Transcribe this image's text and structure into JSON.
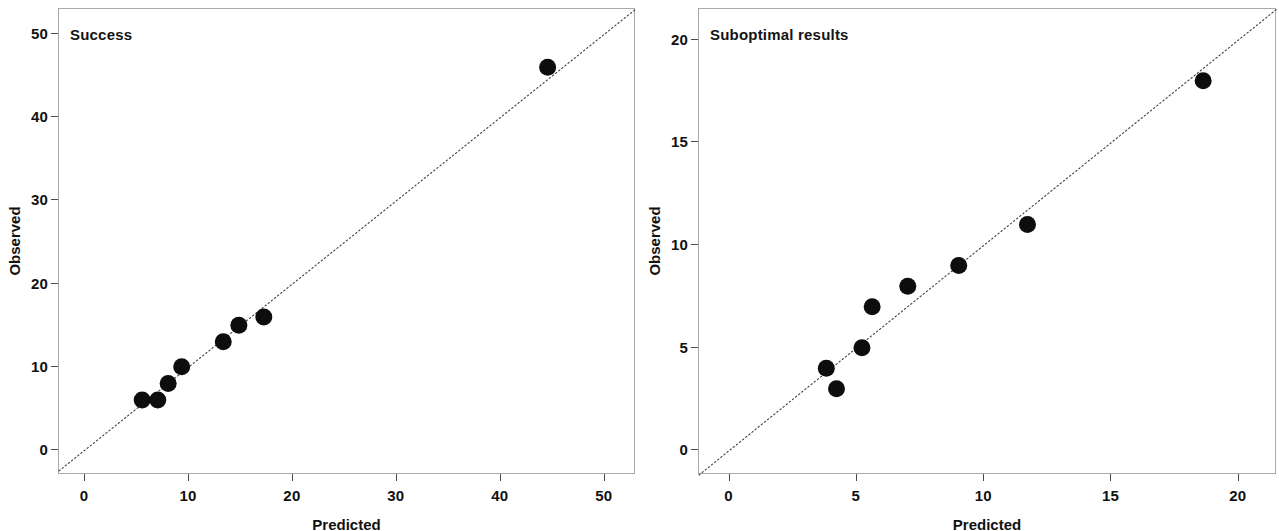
{
  "figure": {
    "background_color": "#ffffff",
    "marker_color": "#0d0d0d",
    "axis_color": "#a9a9a9",
    "reference_line_color": "#3f3f3f"
  },
  "panels": {
    "left": {
      "title": "Success",
      "xlabel": "Predicted",
      "ylabel": "Observed",
      "xticks": [
        "0",
        "10",
        "20",
        "30",
        "40",
        "50"
      ],
      "yticks": [
        "0",
        "10",
        "20",
        "30",
        "40",
        "50"
      ]
    },
    "right": {
      "title": "Suboptimal results",
      "xlabel": "Predicted",
      "ylabel": "Observed",
      "xticks": [
        "0",
        "5",
        "10",
        "15",
        "20"
      ],
      "yticks": [
        "0",
        "5",
        "10",
        "15",
        "20"
      ]
    }
  },
  "chart_data": [
    {
      "type": "scatter",
      "title": "Success",
      "xlabel": "Predicted",
      "ylabel": "Observed",
      "xlim": [
        -2.5,
        53
      ],
      "ylim": [
        -3,
        53
      ],
      "xticks": [
        0,
        10,
        20,
        30,
        40,
        50
      ],
      "yticks": [
        0,
        10,
        20,
        30,
        40,
        50
      ],
      "grid": false,
      "legend": null,
      "reference_line": {
        "type": "identity",
        "slope": 1,
        "intercept": 0,
        "style": "dotted"
      },
      "series": [
        {
          "name": "Success",
          "marker": "filled-circle",
          "x": [
            5.5,
            7.0,
            8.0,
            9.3,
            13.3,
            14.8,
            17.2,
            44.5
          ],
          "y": [
            6,
            6,
            8,
            10,
            13,
            15,
            16,
            46
          ]
        }
      ]
    },
    {
      "type": "scatter",
      "title": "Suboptimal results",
      "xlabel": "Predicted",
      "ylabel": "Observed",
      "xlim": [
        -1.2,
        21.5
      ],
      "ylim": [
        -1.2,
        21.5
      ],
      "xticks": [
        0,
        5,
        10,
        15,
        20
      ],
      "yticks": [
        0,
        5,
        10,
        15,
        20
      ],
      "grid": false,
      "legend": null,
      "reference_line": {
        "type": "identity",
        "slope": 1,
        "intercept": 0,
        "style": "dotted"
      },
      "series": [
        {
          "name": "Suboptimal results",
          "marker": "filled-circle",
          "x": [
            3.8,
            4.2,
            5.2,
            5.6,
            7.0,
            9.0,
            11.7,
            18.6
          ],
          "y": [
            4,
            3,
            5,
            7,
            8,
            9,
            11,
            18
          ]
        }
      ]
    }
  ]
}
